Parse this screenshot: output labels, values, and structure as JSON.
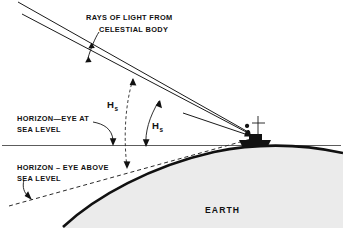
{
  "diagram": {
    "labels": {
      "rays_line1": "RAYS OF LIGHT FROM",
      "rays_line2": "CELESTIAL BODY",
      "horizon_sea_level_line1": "HORIZON—EYE AT",
      "horizon_sea_level_line2": "SEA LEVEL",
      "horizon_above_line1": "HORIZON – EYE ABOVE",
      "horizon_above_line2": "SEA LEVEL",
      "earth": "EARTH",
      "angle_left_symbol": "H",
      "angle_left_subscript": "s",
      "angle_right_symbol": "H",
      "angle_right_subscript": "s"
    },
    "colors": {
      "background": "#ffffff",
      "ink": "#111111",
      "horizon_line": "#4a4a4a",
      "earth_fill": "#ebebeb",
      "dashed_line": "#2a2a2a"
    },
    "elements": {
      "ray_upper": "upper ray of light from celestial body",
      "ray_lower": "lower ray of light from celestial body",
      "horizon_line": "solid horizontal sea-level horizon line",
      "dashed_horizon": "dashed visible-horizon line for elevated eye",
      "earth_curve": "curved surface of the earth",
      "ship": "ship with observer and mast",
      "arc_left": "dashed angle arc marking Hs to dashed horizon",
      "arc_right": "solid angle arc marking Hs to sea-level horizon"
    }
  }
}
